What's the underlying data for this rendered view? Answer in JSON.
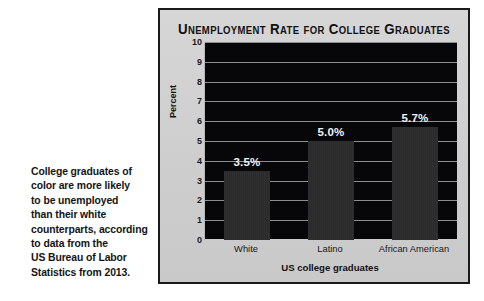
{
  "caption": {
    "text": "College graduates of\ncolor are more likely\nto be unemployed\nthan their white\ncounterparts, according\nto data from the\nUS Bureau of Labor\nStatistics from 2013."
  },
  "chart_data": {
    "type": "bar",
    "title": "Unemployment Rate for College Graduates",
    "xlabel": "US college graduates",
    "ylabel": "Percent",
    "categories": [
      "White",
      "Latino",
      "African American"
    ],
    "values": [
      3.5,
      5.0,
      5.7
    ],
    "data_labels": [
      "3.5%",
      "5.0%",
      "5.7%"
    ],
    "ylim": [
      0,
      10
    ],
    "yticks": [
      0,
      1,
      2,
      3,
      4,
      5,
      6,
      7,
      8,
      9,
      10
    ],
    "ytick_labels": [
      "0",
      "1",
      "2",
      "3",
      "4",
      "5",
      "6",
      "7",
      "8",
      "9",
      "10"
    ],
    "grid": true,
    "legend": "none",
    "colors": {
      "plot_background": "#07070a",
      "panel_background": "#d2d2d2",
      "bar": "#2b2b2b",
      "gridline": "#8d8d8d",
      "data_label": "#f2f2f2",
      "text": "#141414",
      "border": "#1a1a1a"
    }
  }
}
